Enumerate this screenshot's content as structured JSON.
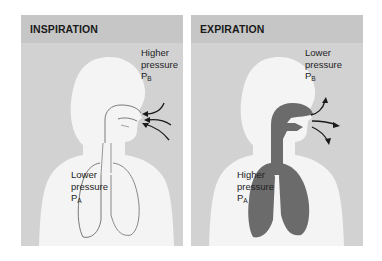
{
  "panels": [
    {
      "title": "INSPIRATION",
      "outside_label": {
        "line1": "Higher",
        "line2": "pressure",
        "symbol": "P",
        "subscript": "B"
      },
      "inside_label": {
        "line1": "Lower",
        "line2": "pressure",
        "symbol": "P",
        "subscript": "A"
      },
      "airflow_direction": "inward",
      "lungs_fill": "#f2f2f2"
    },
    {
      "title": "EXPIRATION",
      "outside_label": {
        "line1": "Lower",
        "line2": "pressure",
        "symbol": "P",
        "subscript": "B"
      },
      "inside_label": {
        "line1": "Higher",
        "line2": "pressure",
        "symbol": "P",
        "subscript": "A"
      },
      "airflow_direction": "outward",
      "lungs_fill": "#6b6b6b"
    }
  ],
  "colors": {
    "panel_bg": "#d2d2d2",
    "header_bg": "#c6c6c6",
    "body_fill": "#f4f4f4",
    "airway_dark": "#6b6b6b",
    "outline": "#6a6a6a",
    "arrow": "#1a1a1a"
  }
}
